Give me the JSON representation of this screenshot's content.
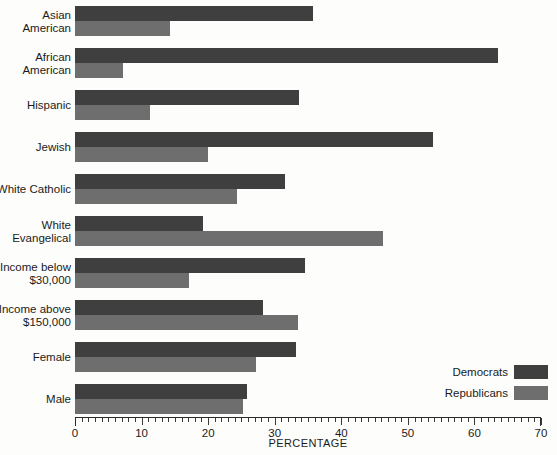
{
  "chart_data": {
    "type": "bar",
    "orientation": "horizontal",
    "title": "",
    "xlabel": "PERCENTAGE",
    "ylabel": "",
    "xlim": [
      0,
      70
    ],
    "xticks": [
      0,
      10,
      20,
      30,
      40,
      50,
      60,
      70
    ],
    "minor_tick_step": 1,
    "grid": false,
    "legend_position": "bottom-right",
    "categories": [
      "Asian\nAmerican",
      "African\nAmerican",
      "Hispanic",
      "Jewish",
      "White Catholic",
      "White\nEvangelical",
      "Income below\n$30,000",
      "Income above\n$150,000",
      "Female",
      "Male"
    ],
    "series": [
      {
        "name": "Democrats",
        "color": "#3f3f3f",
        "values": [
          35.7,
          63.5,
          33.7,
          53.8,
          31.5,
          19.3,
          34.5,
          28.2,
          33.2,
          25.8
        ]
      },
      {
        "name": "Republicans",
        "color": "#6e6e6e",
        "values": [
          14.3,
          7.2,
          11.3,
          20.0,
          24.3,
          46.2,
          17.1,
          33.5,
          27.2,
          25.2
        ]
      }
    ]
  },
  "axis": {
    "tick_labels": [
      "0",
      "10",
      "20",
      "30",
      "40",
      "50",
      "60",
      "70"
    ],
    "title": "PERCENTAGE"
  },
  "legend": {
    "items": [
      {
        "label": "Democrats",
        "color": "#3f3f3f"
      },
      {
        "label": "Republicans",
        "color": "#6e6e6e"
      }
    ]
  }
}
